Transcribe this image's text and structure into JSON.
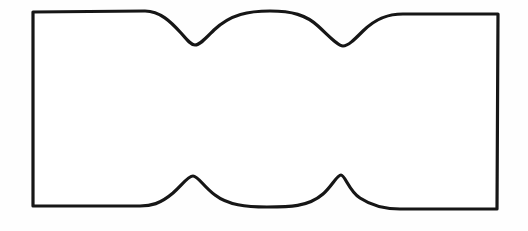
{
  "figure": {
    "name": "hand-drawn-wavy-edged-rectangle",
    "canvas": {
      "width": 528,
      "height": 231,
      "background_color": "#fefefe"
    },
    "style": {
      "stroke_color": "#161616",
      "stroke_width_px": 3.2,
      "fill_color": "#ffffff",
      "line_join": "round",
      "line_cap": "round"
    },
    "corners": {
      "top_left": [
        33,
        12
      ],
      "top_right": [
        498,
        14
      ],
      "bottom_right": [
        497,
        209
      ],
      "bottom_left": [
        33,
        206
      ]
    },
    "top_edge": {
      "flat_left_end": [
        145,
        11
      ],
      "first_notch_bottom": [
        195,
        45
      ],
      "middle_crest": [
        270,
        11
      ],
      "second_notch_bottom": [
        343,
        46
      ],
      "flat_right_start": [
        403,
        14
      ]
    },
    "bottom_edge": {
      "flat_left_end": [
        140,
        206
      ],
      "first_peak_apex": [
        193,
        176
      ],
      "middle_valley": [
        267,
        207
      ],
      "second_peak_apex": [
        341,
        175
      ],
      "flat_right_start": [
        400,
        209
      ]
    },
    "outline_path": "M 33 12 L 145 11 C 160 11 171 22 181 33 C 187 40 191 45 195 45 C 200 45 206 38 214 30 C 231 14 249 11 270 11 C 292 11 306 15 318 26 C 330 37 338 46 343 46 C 348 46 354 40 363 31 C 377 17 390 14 403 14 L 498 14 L 497 209 L 400 209 C 387 209 372 206 360 198 C 349 191 345 175 341 175 C 337 175 332 186 323 194 C 308 207 289 207 267 207 C 246 207 228 205 215 195 C 204 187 198 176 193 176 C 188 176 182 185 173 193 C 160 204 151 206 140 206 L 33 206 Z"
  }
}
